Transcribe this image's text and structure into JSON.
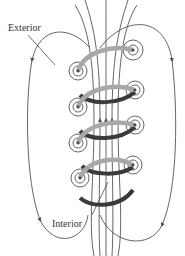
{
  "diagram": {
    "type": "solenoid-magnetic-field",
    "labels": {
      "exterior": "Exterior",
      "interior": "Interior"
    },
    "colors": {
      "field_line": "#555555",
      "coil_front": "#a8a8a8",
      "coil_back": "#3a3a3a",
      "background": "#ffffff"
    },
    "coil_turns": 4
  }
}
